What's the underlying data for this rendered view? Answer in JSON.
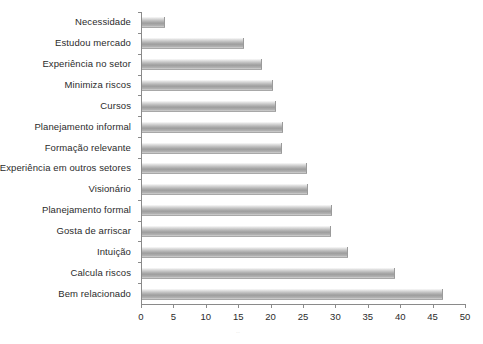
{
  "chart_data": {
    "type": "bar",
    "orientation": "horizontal",
    "title": "",
    "subtitle": "",
    "xlabel": "",
    "ylabel": "",
    "xlim": [
      0,
      50
    ],
    "xticks": [
      0,
      5,
      10,
      15,
      20,
      25,
      30,
      35,
      40,
      45,
      50
    ],
    "grid": false,
    "legend": null,
    "bar_color": "#b0b0b0",
    "categories": [
      "Necessidade",
      "Estudou mercado",
      "Experiência no setor",
      "Minimiza riscos",
      "Cursos",
      "Planejamento informal",
      "Formação relevante",
      "Experiência em outros setores",
      "Visionário",
      "Planejamento formal",
      "Gosta de arriscar",
      "Intuição",
      "Calcula riscos",
      "Bem relacionado"
    ],
    "values": [
      3.5,
      15.7,
      18.5,
      20.2,
      20.7,
      21.8,
      21.6,
      25.5,
      25.6,
      29.3,
      29.2,
      31.8,
      39.0,
      46.5
    ]
  },
  "footer": {
    "faint_mark": ".."
  }
}
